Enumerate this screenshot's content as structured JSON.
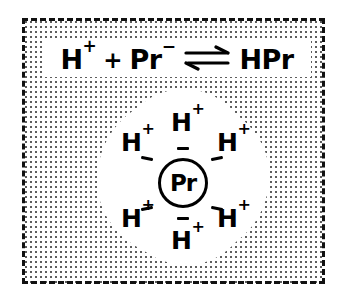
{
  "diagram": {
    "equation": {
      "reactant_1": "H",
      "reactant_1_charge": "+",
      "operator": "+",
      "reactant_2": "Pr",
      "reactant_2_charge": "−",
      "arrow": "equilibrium-arrow",
      "arrow_symbol": "⇌",
      "product": "HPr",
      "full_text": "H+ + Pr− ⇌ HPr"
    },
    "protein": {
      "label": "Pr",
      "negative_charge_count": 6,
      "negative_symbol": "−"
    },
    "ions": [
      {
        "label": "H",
        "charge": "+",
        "position": "top"
      },
      {
        "label": "H",
        "charge": "+",
        "position": "upper-left"
      },
      {
        "label": "H",
        "charge": "+",
        "position": "upper-right"
      },
      {
        "label": "H",
        "charge": "+",
        "position": "lower-left"
      },
      {
        "label": "H",
        "charge": "+",
        "position": "lower-right"
      },
      {
        "label": "H",
        "charge": "+",
        "position": "bottom"
      }
    ],
    "colors": {
      "ink": "#000000",
      "stipple": "#5d5d5d",
      "background": "#ffffff"
    }
  }
}
